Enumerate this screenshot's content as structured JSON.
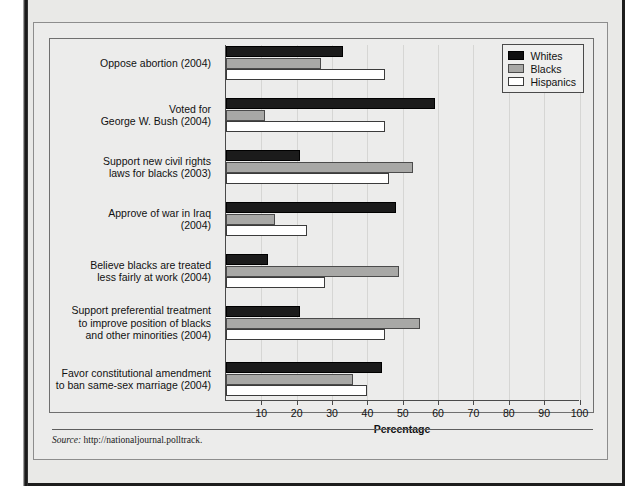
{
  "figure": {
    "source_keyword": "Source:",
    "source_text": "http://nationaljournal.polltrack."
  },
  "legend": {
    "position": "top-right",
    "entries": [
      {
        "label": "Whites",
        "color": "#0f0f0f",
        "icon": "legend-swatch-whites"
      },
      {
        "label": "Blacks",
        "color": "#a8a8a6",
        "icon": "legend-swatch-blacks"
      },
      {
        "label": "Hispanics",
        "color": "#ffffff",
        "icon": "legend-swatch-hispanics"
      }
    ]
  },
  "chart_data": {
    "type": "bar",
    "orientation": "horizontal",
    "title": "",
    "xlabel": "Percentage",
    "ylabel": "",
    "xlim": [
      0,
      100
    ],
    "xticks": [
      10,
      20,
      30,
      40,
      50,
      60,
      70,
      80,
      90,
      100
    ],
    "xtick_labels": [
      "10",
      "20",
      "30",
      "40",
      "50",
      "60",
      "70",
      "80",
      "90",
      "100"
    ],
    "grid": true,
    "categories": [
      "Oppose abortion (2004)",
      "Voted for George W. Bush (2004)",
      "Support new civil rights laws for blacks (2003)",
      "Approve of war in Iraq (2004)",
      "Believe blacks are treated less fairly at work (2004)",
      "Support preferential treatment to improve position of blacks and other minorities (2004)",
      "Favor constitutional amendment to ban same-sex marriage (2004)"
    ],
    "category_lines": [
      [
        "Oppose abortion (2004)"
      ],
      [
        "Voted for",
        "George W. Bush (2004)"
      ],
      [
        "Support new civil rights",
        "laws for blacks (2003)"
      ],
      [
        "Approve of war in Iraq",
        "(2004)"
      ],
      [
        "Believe blacks are treated",
        "less fairly at work (2004)"
      ],
      [
        "Support preferential treatment",
        "to improve position of blacks",
        "and other minorities (2004)"
      ],
      [
        "Favor constitutional amendment",
        "to ban same-sex marriage (2004)"
      ]
    ],
    "series": [
      {
        "name": "Whites",
        "values": [
          33,
          59,
          21,
          48,
          12,
          21,
          44
        ]
      },
      {
        "name": "Blacks",
        "values": [
          27,
          11,
          53,
          14,
          49,
          55,
          36
        ]
      },
      {
        "name": "Hispanics",
        "values": [
          45,
          45,
          46,
          23,
          28,
          45,
          40
        ]
      }
    ]
  }
}
